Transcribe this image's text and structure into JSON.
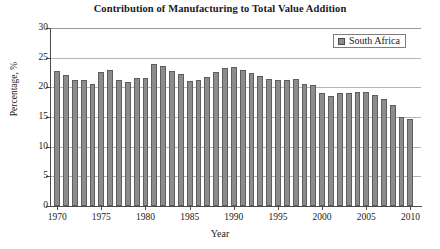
{
  "chart_data": {
    "type": "bar",
    "title": "Contribution of Manufacturing to Total Value Addition",
    "xlabel": "Year",
    "ylabel": "Percentage, %",
    "ylim": [
      0,
      30
    ],
    "yticks": [
      0,
      5,
      10,
      15,
      20,
      25,
      30
    ],
    "xlim": [
      1969.3,
      2011.2
    ],
    "xticks": [
      1970,
      1975,
      1980,
      1985,
      1990,
      1995,
      2000,
      2005,
      2010
    ],
    "grid": "horizontal",
    "legend_position": "top-right",
    "bar_color": "#8c8c8c",
    "bar_edge_color": "#5e5e5e",
    "series": [
      {
        "name": "South Africa",
        "categories": [
          1970,
          1971,
          1972,
          1973,
          1974,
          1975,
          1976,
          1977,
          1978,
          1979,
          1980,
          1981,
          1982,
          1983,
          1984,
          1985,
          1986,
          1987,
          1988,
          1989,
          1990,
          1991,
          1992,
          1993,
          1994,
          1995,
          1996,
          1997,
          1998,
          1999,
          2000,
          2001,
          2002,
          2003,
          2004,
          2005,
          2006,
          2007,
          2008,
          2009,
          2010
        ],
        "values": [
          22.8,
          22.0,
          21.3,
          21.3,
          20.6,
          22.6,
          23.0,
          21.2,
          20.9,
          21.6,
          21.5,
          23.9,
          23.6,
          22.8,
          22.3,
          21.0,
          21.2,
          21.8,
          22.6,
          23.2,
          23.4,
          22.9,
          22.4,
          21.9,
          21.4,
          21.2,
          21.2,
          21.4,
          20.6,
          20.4,
          19.0,
          18.5,
          19.0,
          19.0,
          19.2,
          19.2,
          18.7,
          18.0,
          17.0,
          15.0,
          14.6
        ]
      }
    ]
  },
  "legend": {
    "items": [
      {
        "label": "South Africa",
        "color": "#8c8c8c"
      }
    ]
  }
}
